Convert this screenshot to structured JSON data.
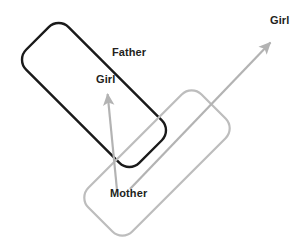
{
  "figure": {
    "title": "",
    "background_color": "#ffffff",
    "shapes": [
      {
        "name": "father-rectangle",
        "label": "Father",
        "stroke_color": "#1a1a1a",
        "stroke_width": 2.4,
        "fill": "none",
        "rotation_deg": -45,
        "corner_radius": 14,
        "center_x": 94,
        "center_y": 95,
        "width": 60,
        "height": 160
      },
      {
        "name": "mother-rectangle",
        "label": "Mother",
        "stroke_color": "#bdbdbd",
        "stroke_width": 2.2,
        "fill": "none",
        "rotation_deg": 45,
        "corner_radius": 14,
        "center_x": 157,
        "center_y": 163,
        "width": 62,
        "height": 160
      }
    ],
    "arrows": [
      {
        "name": "girl-arrow-vertical",
        "label": "Girl",
        "color": "#b3b3b3",
        "stroke_width": 2.2,
        "x1": 117,
        "y1": 190,
        "x2": 107,
        "y2": 90
      },
      {
        "name": "girl-arrow-diagonal",
        "label": "Girl",
        "color": "#b3b3b3",
        "stroke_width": 2.2,
        "x1": 130,
        "y1": 189,
        "x2": 273,
        "y2": 40
      }
    ],
    "labels": {
      "father": "Father",
      "girl_left": "Girl",
      "girl_right": "Girl",
      "mother": "Mother"
    },
    "colors": {
      "black_outline": "#1a1a1a",
      "gray_outline": "#bdbdbd",
      "arrow_gray": "#b3b3b3",
      "text": "#231f20"
    }
  }
}
